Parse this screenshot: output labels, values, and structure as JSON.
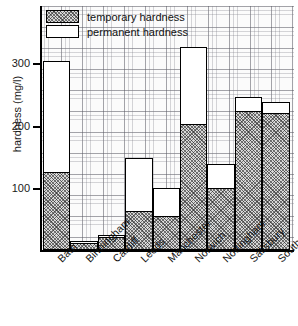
{
  "chart_data": {
    "type": "bar",
    "title": "",
    "subtitle": "",
    "xlabel": "",
    "ylabel": "hardness (mg/l)",
    "ylim": [
      0,
      340
    ],
    "yticks": [
      100,
      200,
      300
    ],
    "ytick_labels": [
      "100",
      "200",
      "300"
    ],
    "grid": true,
    "stacked": true,
    "legend_position": "top-left",
    "categories": [
      "Bath",
      "Birmingham",
      "Cardiff",
      "Leeds",
      "Manchester",
      "Norwich",
      "Nottingham",
      "Salisbury",
      "Southampton"
    ],
    "series": [
      {
        "name": "temporary hardness",
        "values": [
          125,
          10,
          20,
          62,
          53,
          202,
          98,
          222,
          219
        ]
      },
      {
        "name": "permanent hardness",
        "values": [
          180,
          4,
          5,
          86,
          47,
          125,
          40,
          24,
          19
        ]
      }
    ],
    "totals": [
      305,
      14,
      25,
      148,
      100,
      327,
      138,
      246,
      238
    ]
  },
  "legend": {
    "items": [
      {
        "label": "temporary hardness",
        "swatch": "hatched"
      },
      {
        "label": "permanent hardness",
        "swatch": "white"
      }
    ]
  },
  "axis": {
    "y_title": "hardness (mg/l)",
    "y_ticks": [
      "300",
      "200",
      "100"
    ]
  },
  "colors": {
    "axis": "#000000",
    "bar_outline": "#000000",
    "permanent_fill": "#ffffff",
    "temporary_fill": "#d8d8d8",
    "grid": "#78788a",
    "background": "#ffffff"
  }
}
